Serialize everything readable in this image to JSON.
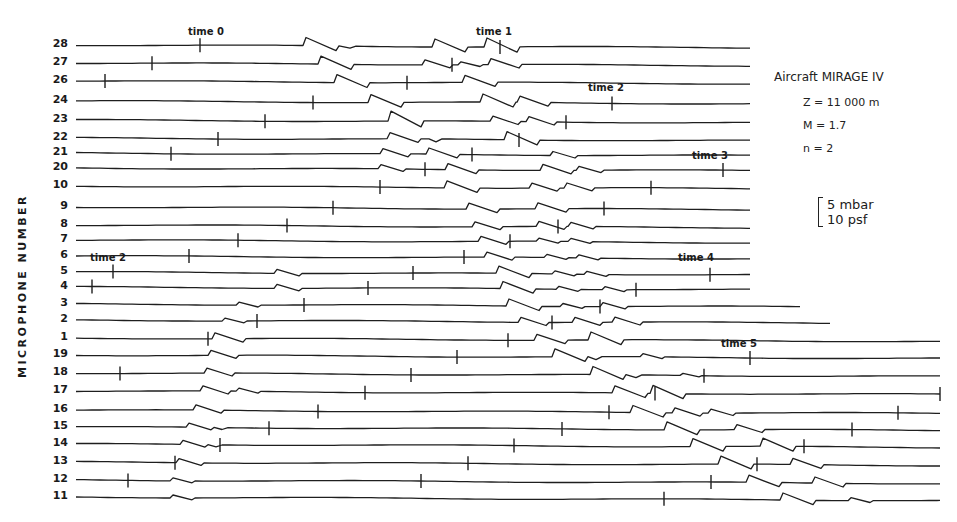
{
  "chart_data": {
    "type": "line",
    "title": "",
    "xlabel": "",
    "ylabel": "MICROPHONE NUMBER",
    "grid": false,
    "legend": null,
    "annotations": {
      "aircraft": "Aircraft  MIRAGE IV",
      "altitude": "Z = 11 000 m",
      "mach": "M = 1.7",
      "n": "n = 2",
      "scale_bar": [
        "5 mbar",
        "10 psf"
      ]
    },
    "time_markers": [
      {
        "label": "time 0",
        "x": 200,
        "y": 38
      },
      {
        "label": "time 1",
        "x": 488,
        "y": 38
      },
      {
        "label": "time 2",
        "x": 600,
        "y": 94
      },
      {
        "label": "time 3",
        "x": 704,
        "y": 162
      },
      {
        "label": "time 2",
        "x": 102,
        "y": 264
      },
      {
        "label": "time 4",
        "x": 690,
        "y": 264
      },
      {
        "label": "time 5",
        "x": 733,
        "y": 350
      }
    ],
    "rows": [
      {
        "mic": "28",
        "y": 45,
        "x_end": 750,
        "ticks": [
          200,
          500
        ],
        "events": [
          [
            303,
            -8
          ],
          [
            344,
            2
          ],
          [
            432,
            -8
          ],
          [
            446,
            -7
          ],
          [
            456,
            6
          ],
          [
            484,
            -9
          ]
        ]
      },
      {
        "mic": "27",
        "y": 63,
        "x_end": 750,
        "ticks": [
          152,
          452
        ],
        "events": [
          [
            318,
            -8
          ],
          [
            348,
            3
          ],
          [
            422,
            -5
          ],
          [
            458,
            -3
          ],
          [
            488,
            -6
          ]
        ]
      },
      {
        "mic": "26",
        "y": 81,
        "x_end": 750,
        "ticks": [
          105,
          407
        ],
        "events": [
          [
            334,
            -8
          ],
          [
            365,
            3
          ],
          [
            462,
            -7
          ],
          [
            498,
            -6
          ]
        ]
      },
      {
        "mic": "24",
        "y": 101,
        "x_end": 750,
        "ticks": [
          313,
          612
        ],
        "events": [
          [
            368,
            -8
          ],
          [
            398,
            3
          ],
          [
            480,
            -8
          ],
          [
            517,
            -6
          ]
        ]
      },
      {
        "mic": "23",
        "y": 120,
        "x_end": 750,
        "ticks": [
          265,
          566
        ],
        "events": [
          [
            388,
            -10
          ],
          [
            420,
            3
          ],
          [
            490,
            -5
          ],
          [
            526,
            -5
          ]
        ]
      },
      {
        "mic": "22",
        "y": 138,
        "x_end": 750,
        "ticks": [
          218,
          519
        ],
        "events": [
          [
            387,
            -6
          ],
          [
            404,
            -6
          ],
          [
            430,
            3
          ],
          [
            504,
            -8
          ],
          [
            540,
            -7
          ]
        ]
      },
      {
        "mic": "21",
        "y": 153,
        "x_end": 750,
        "ticks": [
          171,
          472
        ],
        "events": [
          [
            380,
            -5
          ],
          [
            426,
            -6
          ],
          [
            455,
            3
          ],
          [
            550,
            -4
          ]
        ]
      },
      {
        "mic": "20",
        "y": 168,
        "x_end": 750,
        "ticks": [
          425,
          723
        ],
        "events": [
          [
            378,
            -4
          ],
          [
            445,
            -6
          ],
          [
            470,
            3
          ],
          [
            540,
            -6
          ],
          [
            576,
            -4
          ]
        ]
      },
      {
        "mic": "10",
        "y": 186,
        "x_end": 750,
        "ticks": [
          380,
          651
        ],
        "events": [
          [
            444,
            -7
          ],
          [
            472,
            3
          ],
          [
            529,
            -5
          ],
          [
            564,
            -5
          ]
        ]
      },
      {
        "mic": "9",
        "y": 207,
        "x_end": 750,
        "ticks": [
          333,
          604
        ],
        "events": [
          [
            466,
            -6
          ],
          [
            488,
            3
          ],
          [
            535,
            -6
          ],
          [
            566,
            -6
          ]
        ]
      },
      {
        "mic": "8",
        "y": 225,
        "x_end": 750,
        "ticks": [
          287,
          558
        ],
        "events": [
          [
            472,
            -5
          ],
          [
            500,
            3
          ],
          [
            536,
            -5
          ],
          [
            568,
            -4
          ]
        ]
      },
      {
        "mic": "7",
        "y": 240,
        "x_end": 750,
        "ticks": [
          238,
          510
        ],
        "events": [
          [
            478,
            -5
          ],
          [
            504,
            3
          ],
          [
            536,
            -3
          ],
          [
            568,
            -3
          ]
        ]
      },
      {
        "mic": "6",
        "y": 256,
        "x_end": 750,
        "ticks": [
          189,
          464
        ],
        "events": [
          [
            484,
            -5
          ],
          [
            512,
            3
          ],
          [
            544,
            -3
          ],
          [
            576,
            -3
          ]
        ]
      },
      {
        "mic": "5",
        "y": 272,
        "x_end": 750,
        "ticks": [
          113,
          413,
          710
        ],
        "events": [
          [
            274,
            -4
          ],
          [
            496,
            -7
          ],
          [
            528,
            3
          ],
          [
            552,
            -3
          ],
          [
            584,
            -3
          ]
        ]
      },
      {
        "mic": "4",
        "y": 287,
        "x_end": 750,
        "ticks": [
          92,
          368,
          636
        ],
        "events": [
          [
            274,
            -4
          ],
          [
            500,
            -7
          ],
          [
            532,
            3
          ],
          [
            556,
            -3
          ],
          [
            602,
            -3
          ]
        ]
      },
      {
        "mic": "3",
        "y": 304,
        "x_end": 800,
        "ticks": [
          304,
          600
        ],
        "events": [
          [
            236,
            -3
          ],
          [
            506,
            -7
          ],
          [
            538,
            3
          ],
          [
            560,
            -3
          ],
          [
            600,
            -4
          ]
        ]
      },
      {
        "mic": "2",
        "y": 320,
        "x_end": 830,
        "ticks": [
          257,
          552
        ],
        "events": [
          [
            222,
            -3
          ],
          [
            518,
            -5
          ],
          [
            548,
            3
          ],
          [
            572,
            -5
          ],
          [
            612,
            -5
          ]
        ]
      },
      {
        "mic": "1",
        "y": 338,
        "x_end": 940,
        "ticks": [
          208,
          508
        ],
        "events": [
          [
            212,
            -6
          ],
          [
            238,
            3
          ],
          [
            534,
            -6
          ],
          [
            566,
            3
          ],
          [
            588,
            -8
          ],
          [
            624,
            -8
          ]
        ]
      },
      {
        "mic": "19",
        "y": 355,
        "x_end": 940,
        "ticks": [
          457,
          750
        ],
        "events": [
          [
            208,
            -5
          ],
          [
            234,
            3
          ],
          [
            552,
            -8
          ],
          [
            590,
            3
          ],
          [
            640,
            -3
          ]
        ]
      },
      {
        "mic": "18",
        "y": 373,
        "x_end": 940,
        "ticks": [
          120,
          411,
          704
        ],
        "events": [
          [
            204,
            -5
          ],
          [
            232,
            2
          ],
          [
            590,
            -8
          ],
          [
            630,
            3
          ],
          [
            680,
            -2
          ]
        ]
      },
      {
        "mic": "17",
        "y": 391,
        "x_end": 940,
        "ticks": [
          365,
          655,
          940
        ],
        "events": [
          [
            200,
            -5
          ],
          [
            236,
            -3
          ],
          [
            612,
            -7
          ],
          [
            650,
            -8
          ],
          [
            682,
            -6
          ]
        ]
      },
      {
        "mic": "16",
        "y": 410,
        "x_end": 940,
        "ticks": [
          318,
          609,
          898
        ],
        "events": [
          [
            193,
            -5
          ],
          [
            218,
            2
          ],
          [
            630,
            -7
          ],
          [
            672,
            -5
          ],
          [
            708,
            -4
          ]
        ]
      },
      {
        "mic": "15",
        "y": 427,
        "x_end": 940,
        "ticks": [
          269,
          562,
          852
        ],
        "events": [
          [
            186,
            -4
          ],
          [
            216,
            2
          ],
          [
            664,
            -8
          ],
          [
            700,
            -7
          ],
          [
            734,
            -5
          ]
        ]
      },
      {
        "mic": "14",
        "y": 444,
        "x_end": 940,
        "ticks": [
          220,
          514,
          804
        ],
        "events": [
          [
            180,
            -4
          ],
          [
            210,
            2
          ],
          [
            690,
            -8
          ],
          [
            726,
            -8
          ],
          [
            760,
            -8
          ]
        ]
      },
      {
        "mic": "13",
        "y": 462,
        "x_end": 940,
        "ticks": [
          175,
          468,
          757
        ],
        "events": [
          [
            176,
            -4
          ],
          [
            718,
            -8
          ],
          [
            752,
            -6
          ],
          [
            790,
            -6
          ]
        ]
      },
      {
        "mic": "12",
        "y": 480,
        "x_end": 940,
        "ticks": [
          128,
          421,
          711
        ],
        "events": [
          [
            170,
            -3
          ],
          [
            746,
            -7
          ],
          [
            778,
            -6
          ],
          [
            812,
            -6
          ]
        ]
      },
      {
        "mic": "11",
        "y": 497,
        "x_end": 940,
        "ticks": [
          664
        ],
        "events": [
          [
            170,
            -3
          ],
          [
            780,
            -7
          ],
          [
            814,
            -4
          ],
          [
            848,
            -3
          ]
        ]
      }
    ]
  }
}
